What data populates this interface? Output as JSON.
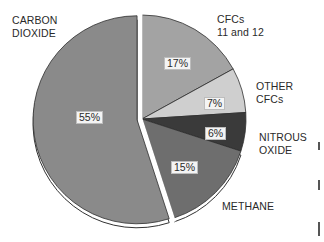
{
  "chart_data": {
    "type": "pie",
    "title": "",
    "start_angle_deg": 0,
    "direction": "clockwise",
    "exploded": "CARBON DIOXIDE",
    "slices": [
      {
        "label": "CFCs 11 and 12",
        "label_lines": [
          "CFCs",
          "11 and 12"
        ],
        "value": 17,
        "value_label": "17%",
        "color": "#a3a3a3"
      },
      {
        "label": "OTHER CFCs",
        "label_lines": [
          "OTHER",
          "CFCs"
        ],
        "value": 7,
        "value_label": "7%",
        "color": "#cfcfcf"
      },
      {
        "label": "NITROUS OXIDE",
        "label_lines": [
          "NITROUS",
          "OXIDE"
        ],
        "value": 6,
        "value_label": "6%",
        "color": "#3a3a3a"
      },
      {
        "label": "METHANE",
        "label_lines": [
          "METHANE"
        ],
        "value": 15,
        "value_label": "15%",
        "color": "#6e6e6e"
      },
      {
        "label": "CARBON DIOXIDE",
        "label_lines": [
          "CARBON",
          "DIOXIDE"
        ],
        "value": 55,
        "value_label": "55%",
        "color": "#8a8a8a"
      }
    ],
    "legend": "none (direct labels)"
  },
  "labels": {
    "co2": [
      "CARBON",
      "DIOXIDE"
    ],
    "cfc1112": [
      "CFCs",
      "11 and 12"
    ],
    "other": [
      "OTHER",
      "CFCs"
    ],
    "n2o": [
      "NITROUS",
      "OXIDE"
    ],
    "ch4": [
      "METHANE"
    ]
  },
  "percents": {
    "co2": "55%",
    "cfc1112": "17%",
    "other": "7%",
    "n2o": "6%",
    "ch4": "15%"
  }
}
